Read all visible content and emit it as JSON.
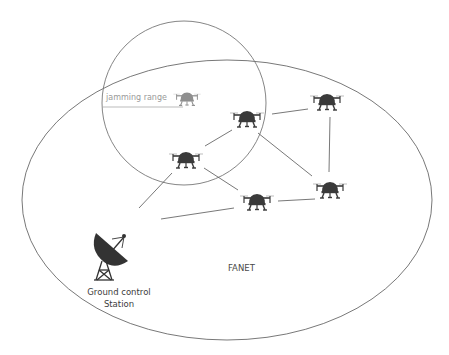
{
  "diagram": {
    "type": "network-topology",
    "labels": {
      "jamming_range": "jamming range",
      "network": "FANET",
      "ground_station_line1": "Ground control",
      "ground_station_line2": "Station"
    },
    "colors": {
      "background": "#ffffff",
      "outline": "#555555",
      "drone": "#3a3a3a",
      "jammer_drone": "#8f8f8f",
      "jamming_label": "#9a9a9a",
      "link": "#555555"
    },
    "regions": [
      {
        "id": "fanet-area",
        "shape": "ellipse",
        "cx": 227,
        "cy": 200,
        "rx": 205,
        "ry": 140
      },
      {
        "id": "jamming-range",
        "shape": "circle",
        "cx": 184,
        "cy": 103,
        "r": 82
      }
    ],
    "nodes": [
      {
        "id": "jammer",
        "kind": "jamming-drone",
        "x": 187,
        "y": 99
      },
      {
        "id": "d1",
        "kind": "drone",
        "x": 247,
        "y": 119
      },
      {
        "id": "d2",
        "kind": "drone",
        "x": 186,
        "y": 160
      },
      {
        "id": "d3",
        "kind": "drone",
        "x": 327,
        "y": 102
      },
      {
        "id": "d4",
        "kind": "drone",
        "x": 257,
        "y": 202
      },
      {
        "id": "d5",
        "kind": "drone",
        "x": 330,
        "y": 190
      },
      {
        "id": "gcs",
        "kind": "ground-control-station",
        "x": 108,
        "y": 258
      }
    ],
    "links": [
      [
        "d1",
        "d3"
      ],
      [
        "d1",
        "d2"
      ],
      [
        "d1",
        "d5"
      ],
      [
        "d3",
        "d5"
      ],
      [
        "d2",
        "d4"
      ],
      [
        "d4",
        "d5"
      ],
      [
        "d2",
        "gcs"
      ],
      [
        "gcs",
        "d4"
      ]
    ]
  }
}
